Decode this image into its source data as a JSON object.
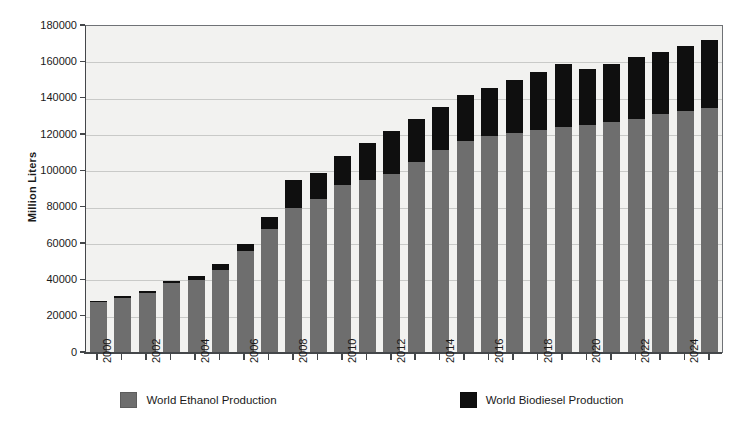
{
  "chart_data": {
    "type": "bar",
    "subtype": "stacked-vertical",
    "title": "",
    "subtitle": "",
    "xlabel": "",
    "ylabel": "Million Liters",
    "ylim": [
      0,
      180000
    ],
    "ytick_step": 20000,
    "yticks": [
      "0",
      "20000",
      "40000",
      "60000",
      "80000",
      "100000",
      "120000",
      "140000",
      "160000",
      "180000"
    ],
    "grid": true,
    "grid_axis": "y",
    "legend_position": "bottom-center",
    "x": [
      2000,
      2001,
      2002,
      2003,
      2004,
      2005,
      2006,
      2007,
      2008,
      2009,
      2010,
      2011,
      2012,
      2013,
      2014,
      2015,
      2016,
      2017,
      2018,
      2019,
      2020,
      2021,
      2022,
      2023,
      2024,
      2025
    ],
    "categories": [
      "2000",
      "2001",
      "2002",
      "2003",
      "2004",
      "2005",
      "2006",
      "2007",
      "2008",
      "2009",
      "2010",
      "2011",
      "2012",
      "2013",
      "2014",
      "2015",
      "2016",
      "2017",
      "2018",
      "2019",
      "2020",
      "2021",
      "2022",
      "2023",
      "2024",
      "2025"
    ],
    "xtick_labels_shown": [
      "2000",
      "2002",
      "2004",
      "2006",
      "2008",
      "2010",
      "2012",
      "2014",
      "2016",
      "2018",
      "2020",
      "2022",
      "2024"
    ],
    "xtick_label_rotation": -90,
    "series": [
      {
        "name": "World Ethanol Production",
        "color": "#6e6e6e",
        "values": [
          28000,
          30500,
          33000,
          38500,
          40000,
          45500,
          56000,
          68000,
          80000,
          85000,
          92500,
          95500,
          98500,
          105000,
          111500,
          116500,
          119500,
          121000,
          123000,
          124500,
          125500,
          127000,
          129000,
          131500,
          133000,
          135000
        ]
      },
      {
        "name": "World Biodiesel Production",
        "color": "#0f0f0f",
        "values": [
          900,
          900,
          1200,
          1400,
          2200,
          3500,
          4000,
          6800,
          15000,
          14000,
          16000,
          20000,
          23500,
          24000,
          24000,
          25500,
          26500,
          29500,
          31500,
          34500,
          31000,
          32000,
          34000,
          34000,
          36000,
          37500
        ]
      }
    ],
    "totals": [
      28900,
      31400,
      34200,
      39900,
      42200,
      49000,
      60000,
      74800,
      95000,
      99000,
      108500,
      115500,
      122000,
      129000,
      135500,
      142000,
      146000,
      150500,
      154500,
      159000,
      156500,
      159000,
      163000,
      165500,
      169000,
      172500
    ]
  },
  "axes": {
    "y_title": "Million Liters"
  },
  "legend": {
    "items": [
      {
        "label": "World Ethanol Production",
        "color": "#6e6e6e",
        "swatch": "legend-swatch-ethanol"
      },
      {
        "label": "World Biodiesel Production",
        "color": "#0f0f0f",
        "swatch": "legend-swatch-biodiesel"
      }
    ]
  },
  "colors": {
    "ethanol": "#6e6e6e",
    "biodiesel": "#0f0f0f",
    "plot_background": "#f2f2f0",
    "gridline": "#c9cac8",
    "axis": "#44474a",
    "page_background": "#ffffff"
  }
}
